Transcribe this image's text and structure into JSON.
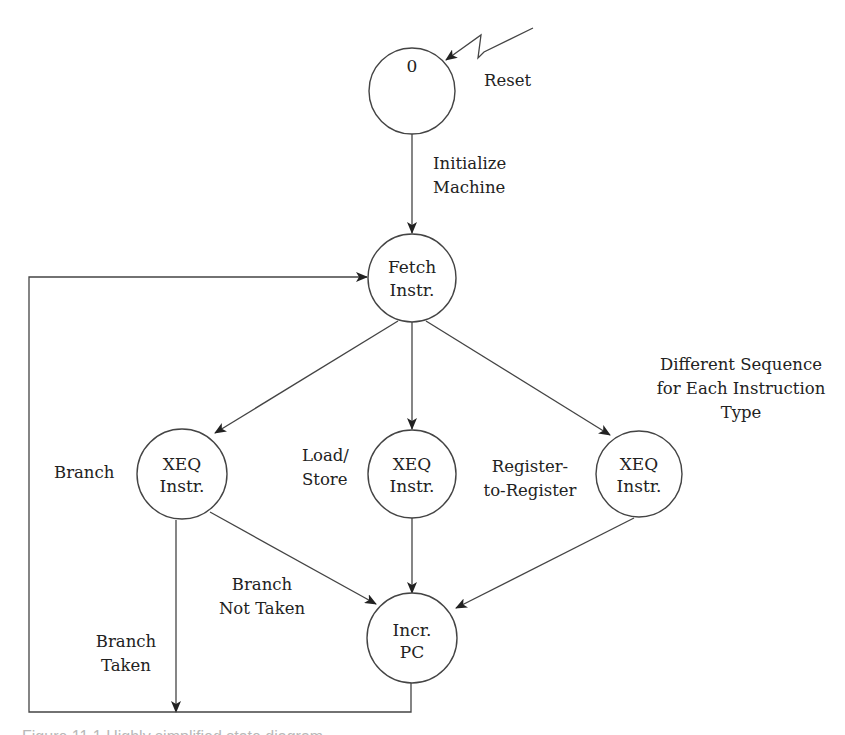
{
  "diagram": {
    "type": "state-diagram",
    "nodes": {
      "reset_state": {
        "label_line1": "0",
        "label_line2": ""
      },
      "fetch": {
        "label_line1": "Fetch",
        "label_line2": "Instr."
      },
      "xeq_branch": {
        "label_line1": "XEQ",
        "label_line2": "Instr."
      },
      "xeq_load_store": {
        "label_line1": "XEQ",
        "label_line2": "Instr."
      },
      "xeq_reg_reg": {
        "label_line1": "XEQ",
        "label_line2": "Instr."
      },
      "incr_pc": {
        "label_line1": "Incr.",
        "label_line2": "PC"
      }
    },
    "labels": {
      "reset": "Reset",
      "init_line1": "Initialize",
      "init_line2": "Machine",
      "different_line1": "Different Sequence",
      "different_line2": "for Each Instruction",
      "different_line3": "Type",
      "branch": "Branch",
      "load_store_line1": "Load/",
      "load_store_line2": "Store",
      "reg_reg_line1": "Register-",
      "reg_reg_line2": "to-Register",
      "branch_not_taken_line1": "Branch",
      "branch_not_taken_line2": "Not Taken",
      "branch_taken_line1": "Branch",
      "branch_taken_line2": "Taken"
    },
    "edges": [
      {
        "from": "reset_signal",
        "to": "reset_state",
        "label": "Reset"
      },
      {
        "from": "reset_state",
        "to": "fetch",
        "label": "Initialize Machine"
      },
      {
        "from": "fetch",
        "to": "xeq_branch",
        "label": "Branch"
      },
      {
        "from": "fetch",
        "to": "xeq_load_store",
        "label": "Load/Store"
      },
      {
        "from": "fetch",
        "to": "xeq_reg_reg",
        "label": "Register-to-Register"
      },
      {
        "from": "xeq_branch",
        "to": "incr_pc",
        "label": "Branch Not Taken"
      },
      {
        "from": "xeq_load_store",
        "to": "incr_pc",
        "label": ""
      },
      {
        "from": "xeq_reg_reg",
        "to": "incr_pc",
        "label": ""
      },
      {
        "from": "xeq_branch",
        "to": "fetch",
        "label": "Branch Taken"
      },
      {
        "from": "incr_pc",
        "to": "fetch",
        "label": ""
      }
    ],
    "caption": "Figure 11.1  Highly simplified state diagram"
  }
}
